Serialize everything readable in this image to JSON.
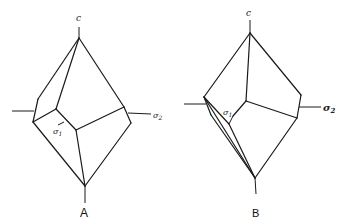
{
  "figure": {
    "panels": [
      {
        "id": "A",
        "caption": "A",
        "labels": {
          "c_axis": "c",
          "sigma1": "σ",
          "sigma1_sub": "1",
          "sigma2": "σ",
          "sigma2_sub": "2"
        }
      },
      {
        "id": "B",
        "caption": "B",
        "labels": {
          "c_axis": "c",
          "sigma1": "σ",
          "sigma1_sub": "1",
          "sigma2": "σ",
          "sigma2_sub": "2"
        }
      }
    ],
    "colors": {
      "line": "#1a1a1a",
      "background": "#ffffff"
    }
  }
}
